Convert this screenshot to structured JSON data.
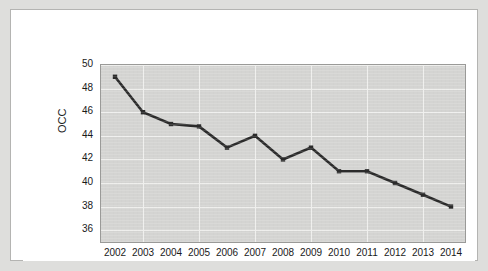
{
  "chart_data": {
    "type": "line",
    "title": "",
    "xlabel": "",
    "ylabel": "OCC",
    "categories": [
      "2002",
      "2003",
      "2004",
      "2005",
      "2006",
      "2007",
      "2008",
      "2009",
      "2010",
      "2011",
      "2012",
      "2013",
      "2014"
    ],
    "values": [
      49,
      46,
      45,
      44.8,
      43,
      44,
      42,
      43,
      41,
      41,
      40,
      39,
      38
    ],
    "series": [
      {
        "name": "OCC",
        "values": [
          49,
          46,
          45,
          44.8,
          43,
          44,
          42,
          43,
          41,
          41,
          40,
          39,
          38
        ]
      }
    ],
    "ylim": [
      35,
      50
    ],
    "yticks": [
      36,
      38,
      40,
      42,
      44,
      46,
      48,
      50
    ],
    "ytick_labels": [
      "36",
      "38",
      "40",
      "42",
      "44",
      "46",
      "48",
      "50"
    ],
    "xtick_labels": [
      "2002",
      "2003",
      "2004",
      "2005",
      "2006",
      "2007",
      "2008",
      "2009",
      "2010",
      "2011",
      "2012",
      "2013",
      "2014"
    ],
    "grid": true,
    "legend": "none",
    "line_color": "#2b2b2b",
    "marker": "square",
    "plot_background": "#d4d4d2",
    "figure_background": "#ffffff",
    "outer_background": "#dededc"
  }
}
